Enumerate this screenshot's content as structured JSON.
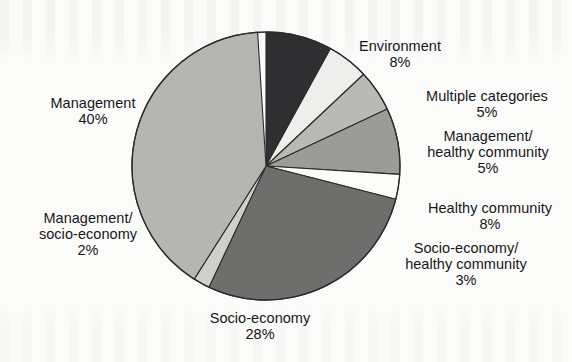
{
  "chart_data": {
    "type": "pie",
    "title": "",
    "subtitle": "",
    "xlabel": "",
    "ylabel": "",
    "legend_position": "none",
    "grid": false,
    "value_unit": "%",
    "total": 99,
    "categories": [
      "Environment",
      "Multiple categories",
      "Management/ healthy community",
      "Healthy community",
      "Socio-economy/ healthy community",
      "Socio-economy",
      "Management/ socio-economy",
      "Management"
    ],
    "values": [
      8,
      5,
      5,
      8,
      3,
      28,
      2,
      40
    ],
    "slices": [
      {
        "name": "Environment",
        "label_lines": [
          "Environment"
        ],
        "value": 8,
        "value_text": "8%",
        "color": "#2f2f31",
        "start_angle": 0,
        "end_angle": 28.8
      },
      {
        "name": "Multiple categories",
        "label_lines": [
          "Multiple categories"
        ],
        "value": 5,
        "value_text": "5%",
        "color": "#eeeeec",
        "start_angle": 28.8,
        "end_angle": 46.8
      },
      {
        "name": "Management/ healthy community",
        "label_lines": [
          "Management/",
          "healthy community"
        ],
        "value": 5,
        "value_text": "5%",
        "color": "#b9b9b6",
        "start_angle": 46.8,
        "end_angle": 64.8
      },
      {
        "name": "Healthy community",
        "label_lines": [
          "Healthy community"
        ],
        "value": 8,
        "value_text": "8%",
        "color": "#9b9b98",
        "start_angle": 64.8,
        "end_angle": 93.6
      },
      {
        "name": "Socio-economy/ healthy community",
        "label_lines": [
          "Socio-economy/",
          "healthy community"
        ],
        "value": 3,
        "value_text": "3%",
        "color": "#fbfbf8",
        "start_angle": 93.6,
        "end_angle": 104.4
      },
      {
        "name": "Socio-economy",
        "label_lines": [
          "Socio-economy"
        ],
        "value": 28,
        "value_text": "28%",
        "color": "#6e6e6c",
        "start_angle": 104.4,
        "end_angle": 205.2
      },
      {
        "name": "Management/ socio-economy",
        "label_lines": [
          "Management/",
          "socio-economy"
        ],
        "value": 2,
        "value_text": "2%",
        "color": "#cfcfcc",
        "start_angle": 205.2,
        "end_angle": 212.4
      },
      {
        "name": "Management",
        "label_lines": [
          "Management"
        ],
        "value": 40,
        "value_text": "40%",
        "color": "#b5b5b2",
        "start_angle": 212.4,
        "end_angle": 356.4
      }
    ],
    "geometry": {
      "center_x": 266,
      "center_y": 166,
      "radius": 134,
      "start_at_twelve_oclock": true,
      "direction": "clockwise"
    },
    "style": {
      "background": "#fbfbfa",
      "stroke": "#2b2b2b",
      "stroke_width": 1.1
    }
  },
  "labels": {
    "management": {
      "line1": "Management",
      "pct": "40%"
    },
    "mgmt_socioecon": {
      "line1": "Management/",
      "line2": "socio-economy",
      "pct": "2%"
    },
    "socio_economy": {
      "line1": "Socio-economy",
      "pct": "28%"
    },
    "environment": {
      "line1": "Environment",
      "pct": "8%"
    },
    "multiple": {
      "line1": "Multiple categories",
      "pct": "5%"
    },
    "mgmt_healthy": {
      "line1": "Management/",
      "line2": "healthy community",
      "pct": "5%"
    },
    "healthy": {
      "line1": "Healthy community",
      "pct": "8%"
    },
    "socio_healthy": {
      "line1": "Socio-economy/",
      "line2": "healthy community",
      "pct": "3%"
    }
  }
}
